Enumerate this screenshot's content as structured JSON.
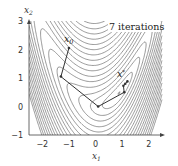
{
  "chart_data": {
    "type": "contour",
    "title": "",
    "xlabel": "x1",
    "ylabel": "x2",
    "xlim": [
      -2.5,
      2.5
    ],
    "ylim": [
      -1,
      3
    ],
    "xticks": [
      -2,
      -1,
      0,
      1,
      2
    ],
    "yticks": [
      -1,
      0,
      1,
      2,
      3
    ],
    "xtick_labels": [
      "−2",
      "−1",
      "0",
      "1",
      "2"
    ],
    "ytick_labels": [
      "−1",
      "0",
      "1",
      "2",
      "3"
    ],
    "grid": false,
    "function_approx": "f = 2*(x2 - 0.6*x1^2)^2 + 0.25*(x1 - 1.15)^2 + 0.05*x1^4",
    "contour_levels": [
      0.05,
      0.2,
      0.45,
      0.8,
      1.3,
      1.9,
      2.6,
      3.5,
      4.5,
      5.6,
      6.9,
      8.3,
      9.8,
      11.5,
      13.3,
      15.2,
      17.3,
      19.5,
      22,
      24.5,
      27
    ],
    "path": {
      "name": "descent iterates",
      "points": [
        {
          "x1": -1.0,
          "x2": 2.05
        },
        {
          "x1": -1.3,
          "x2": 1.05
        },
        {
          "x1": 0.1,
          "x2": 0.0
        },
        {
          "x1": 1.08,
          "x2": 0.5
        },
        {
          "x1": 1.05,
          "x2": 0.73
        },
        {
          "x1": 1.12,
          "x2": 0.8
        },
        {
          "x1": 1.2,
          "x2": 0.88
        }
      ]
    },
    "annotations": [
      {
        "text": "x0",
        "x1": -1.1,
        "x2": 2.35,
        "kind": "start-label"
      },
      {
        "text": "x*",
        "x1": 0.95,
        "x2": 1.15,
        "kind": "optimum-label"
      },
      {
        "text": "7 iterations",
        "x1": 1.55,
        "x2": 2.8,
        "kind": "caption"
      }
    ],
    "colors": {
      "contour": "#555555",
      "path": "#333333",
      "axis": "#444444"
    }
  },
  "labels": {
    "xlabel": "x",
    "xlabel_sub": "1",
    "ylabel": "x",
    "ylabel_sub": "2",
    "x0": "x",
    "x0_sub": "0",
    "xstar": "x",
    "xstar_sup": "*",
    "iterations": "7 iterations"
  }
}
